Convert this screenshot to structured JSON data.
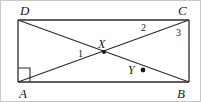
{
  "figure": {
    "width": 201,
    "height": 102,
    "background_color": "#ffffff",
    "stroke_color": "#2b2b2b",
    "frame_color": "#c8c8c8"
  },
  "vertices": {
    "d": {
      "label": "D",
      "x": 18,
      "y": 20,
      "label_x": 20,
      "label_y": 4
    },
    "c": {
      "label": "C",
      "x": 189,
      "y": 20,
      "label_x": 178,
      "label_y": 4
    },
    "a": {
      "label": "A",
      "x": 18,
      "y": 82,
      "label_x": 19,
      "label_y": 87
    },
    "b": {
      "label": "B",
      "x": 189,
      "y": 82,
      "label_x": 177,
      "label_y": 87
    }
  },
  "points": {
    "x": {
      "label": "X",
      "x": 104,
      "y": 52,
      "label_x": 98,
      "label_y": 38,
      "has_dot": true
    },
    "y": {
      "label": "Y",
      "x": 143,
      "y": 70,
      "label_x": 128,
      "label_y": 64,
      "has_dot": true
    }
  },
  "angles": [
    {
      "label": "1",
      "x": 78,
      "y": 49
    },
    {
      "label": "2",
      "x": 141,
      "y": 23
    },
    {
      "label": "3",
      "x": 176,
      "y": 28
    }
  ],
  "markers": {
    "right_angle": {
      "name": "right-angle-marker",
      "at_vertex": "A",
      "size": 12
    }
  },
  "segments": [
    {
      "name": "side-DC",
      "from": "D",
      "to": "C"
    },
    {
      "name": "side-CB",
      "from": "C",
      "to": "B"
    },
    {
      "name": "side-BA",
      "from": "B",
      "to": "A"
    },
    {
      "name": "side-AD",
      "from": "A",
      "to": "D"
    },
    {
      "name": "diagonal-AC",
      "from": "A",
      "to": "C"
    },
    {
      "name": "diagonal-DB",
      "from": "D",
      "to": "B"
    }
  ]
}
